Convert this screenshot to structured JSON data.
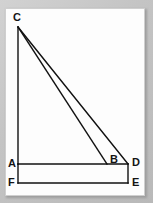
{
  "figure": {
    "canvas": {
      "width": 153,
      "height": 203
    },
    "page": {
      "x": 5,
      "y": 8,
      "width": 140,
      "height": 188,
      "fill": "#fdfdfd",
      "border": "#cfcfcf"
    },
    "background": "#c8c8c8",
    "stroke_color": "#111111",
    "stroke_width": 1.4,
    "points": {
      "C": {
        "x": 18,
        "y": 27,
        "label": "C",
        "label_x": 13,
        "label_y": 12
      },
      "A": {
        "x": 18,
        "y": 164,
        "label": "A",
        "label_x": 8,
        "label_y": 158
      },
      "B": {
        "x": 107,
        "y": 164,
        "label": "B",
        "label_x": 110,
        "label_y": 154
      },
      "D": {
        "x": 128,
        "y": 164,
        "label": "D",
        "label_x": 132,
        "label_y": 157
      },
      "F": {
        "x": 18,
        "y": 183,
        "label": "F",
        "label_x": 8,
        "label_y": 177
      },
      "E": {
        "x": 128,
        "y": 183,
        "label": "E",
        "label_x": 132,
        "label_y": 177
      }
    },
    "segments": [
      {
        "name": "segment-CA",
        "from": "C",
        "to": "A"
      },
      {
        "name": "segment-CB",
        "from": "C",
        "to": "B"
      },
      {
        "name": "segment-CD",
        "from": "C",
        "to": "D"
      },
      {
        "name": "segment-AD",
        "from": "A",
        "to": "D"
      },
      {
        "name": "segment-DE",
        "from": "D",
        "to": "E"
      },
      {
        "name": "segment-EF",
        "from": "E",
        "to": "F"
      },
      {
        "name": "segment-FA",
        "from": "F",
        "to": "A"
      }
    ],
    "labels": [
      "C",
      "A",
      "B",
      "D",
      "F",
      "E"
    ]
  }
}
